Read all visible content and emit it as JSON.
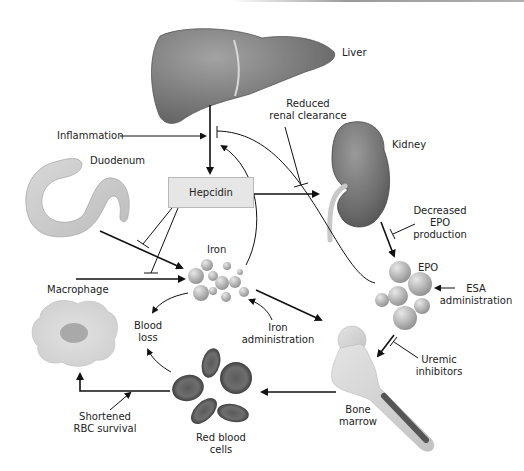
{
  "diagram": {
    "type": "pathway",
    "nodes": {
      "liver": {
        "label": "Liver"
      },
      "kidney": {
        "label": "Kidney"
      },
      "duodenum": {
        "label": "Duodenum"
      },
      "hepcidin": {
        "label": "Hepcidin"
      },
      "iron": {
        "label": "Iron"
      },
      "epo": {
        "label": "EPO"
      },
      "macrophage": {
        "label": "Macrophage"
      },
      "bone_marrow": {
        "label_line1": "Bone",
        "label_line2": "marrow"
      },
      "red_blood_cells": {
        "label_line1": "Red blood",
        "label_line2": "cells"
      }
    },
    "modifiers": {
      "inflammation": {
        "label": "Inflammation"
      },
      "reduced_renal_clearance": {
        "line1": "Reduced",
        "line2": "renal clearance"
      },
      "decreased_epo": {
        "line1": "Decreased",
        "line2": "EPO",
        "line3": "production"
      },
      "esa_administration": {
        "line1": "ESA",
        "line2": "administration"
      },
      "uremic_inhibitors": {
        "line1": "Uremic",
        "line2": "inhibitors"
      },
      "iron_administration": {
        "line1": "Iron",
        "line2": "administration"
      },
      "blood_loss": {
        "line1": "Blood",
        "line2": "loss"
      },
      "shortened_rbc": {
        "line1": "Shortened",
        "line2": "RBC survival"
      }
    },
    "edges": [
      {
        "from": "Liver",
        "to": "Hepcidin",
        "type": "activate"
      },
      {
        "from": "Inflammation",
        "to": "Liver→Hepcidin",
        "type": "activate"
      },
      {
        "from": "Iron",
        "to": "Liver→Hepcidin",
        "type": "activate"
      },
      {
        "from": "EPO",
        "to": "Liver→Hepcidin",
        "type": "inhibit"
      },
      {
        "from": "Hepcidin",
        "to": "Kidney",
        "type": "activate"
      },
      {
        "from": "Reduced renal clearance",
        "to": "Hepcidin→Kidney",
        "type": "inhibit"
      },
      {
        "from": "Hepcidin",
        "to": "Duodenum→Iron",
        "type": "inhibit"
      },
      {
        "from": "Hepcidin",
        "to": "Macrophage→Iron",
        "type": "inhibit"
      },
      {
        "from": "Duodenum",
        "to": "Iron",
        "type": "activate"
      },
      {
        "from": "Macrophage",
        "to": "Iron",
        "type": "activate"
      },
      {
        "from": "Kidney",
        "to": "EPO",
        "type": "activate"
      },
      {
        "from": "Decreased EPO production",
        "to": "Kidney→EPO",
        "type": "inhibit"
      },
      {
        "from": "ESA administration",
        "to": "EPO",
        "type": "activate"
      },
      {
        "from": "EPO",
        "to": "Bone marrow",
        "type": "activate"
      },
      {
        "from": "Uremic inhibitors",
        "to": "EPO→Bone marrow",
        "type": "inhibit"
      },
      {
        "from": "Iron",
        "to": "Bone marrow",
        "type": "activate"
      },
      {
        "from": "Iron administration",
        "to": "Iron",
        "type": "activate"
      },
      {
        "from": "Iron",
        "to": "Blood loss",
        "type": "activate"
      },
      {
        "from": "Bone marrow",
        "to": "Red blood cells",
        "type": "activate"
      },
      {
        "from": "Red blood cells",
        "to": "Blood loss",
        "type": "activate"
      },
      {
        "from": "Red blood cells",
        "to": "Macrophage",
        "type": "activate"
      },
      {
        "from": "Shortened RBC survival",
        "to": "Red blood cells→Macrophage",
        "type": "activate"
      }
    ],
    "colors": {
      "organ_dark": "#6e6e6e",
      "organ_mid": "#8a8a8a",
      "sphere": "#b5b5b5",
      "hepcidin_box": "#e6e6e6",
      "line": "#111111"
    }
  }
}
